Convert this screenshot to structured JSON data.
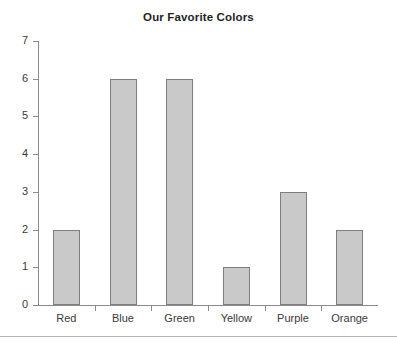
{
  "chart_data": {
    "type": "bar",
    "title": "Our Favorite Colors",
    "xlabel": "",
    "ylabel": "",
    "categories": [
      "Red",
      "Blue",
      "Green",
      "Yellow",
      "Purple",
      "Orange"
    ],
    "values": [
      2,
      6,
      6,
      1,
      3,
      2
    ],
    "ylim": [
      0,
      7
    ],
    "yticks": [
      0,
      1,
      2,
      3,
      4,
      5,
      6,
      7
    ],
    "ytick_labels": [
      "0",
      "1",
      "2",
      "3",
      "4",
      "5",
      "6",
      "7"
    ],
    "grid": false,
    "legend": null,
    "bar_fill_color": "#c9c9c9",
    "bar_border_color": "#7e7e7e",
    "axis_color": "#8a8a8a",
    "text_color": "#3a3a3a",
    "background_color": "#ffffff"
  }
}
